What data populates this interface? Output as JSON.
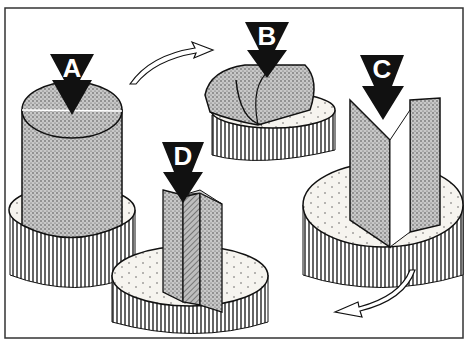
{
  "figure": {
    "colors": {
      "ink": "#111111",
      "wood": "#9a9a9a",
      "stump_top": "#f4f2ee",
      "frame": "#333333",
      "background": "#ffffff"
    }
  },
  "steps": [
    {
      "label": "A",
      "caption": "Split round log through center"
    },
    {
      "label": "B",
      "caption": "Split half lengthwise"
    },
    {
      "label": "C",
      "caption": "Split quarter into wedge"
    },
    {
      "label": "D",
      "caption": "Split into final pieces"
    }
  ],
  "arrows": [
    {
      "name": "flow-arrow-a-to-b",
      "direction": "right"
    },
    {
      "name": "flow-arrow-c-to-d",
      "direction": "left"
    }
  ]
}
